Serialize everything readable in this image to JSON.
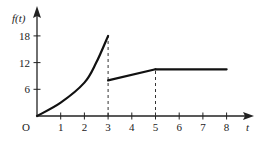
{
  "chart_data": {
    "type": "line",
    "title": "",
    "xlabel": "t",
    "ylabel": "f(t)",
    "origin_label": "O",
    "xlim": [
      0,
      9
    ],
    "ylim": [
      0,
      20
    ],
    "x_ticks": [
      "1",
      "2",
      "3",
      "4",
      "5",
      "6",
      "7",
      "8"
    ],
    "y_ticks": [
      "6",
      "12",
      "18"
    ],
    "grid": false,
    "legend": null,
    "series": [
      {
        "name": "segment-1-curve",
        "style": "solid-curve",
        "x": [
          0,
          1,
          2,
          2.5,
          3
        ],
        "y": [
          0,
          3,
          7.5,
          12,
          18
        ]
      },
      {
        "name": "segment-2-line",
        "style": "solid-line",
        "x": [
          3,
          5
        ],
        "y": [
          8,
          10.5
        ]
      },
      {
        "name": "segment-3-flat",
        "style": "solid-line",
        "x": [
          5,
          8
        ],
        "y": [
          10.5,
          10.5
        ]
      }
    ],
    "annotations": [
      {
        "type": "dashed-vertical",
        "x": 3,
        "y_from": 0,
        "y_to": 18
      },
      {
        "type": "dashed-vertical",
        "x": 5,
        "y_from": 0,
        "y_to": 10.5
      }
    ]
  }
}
